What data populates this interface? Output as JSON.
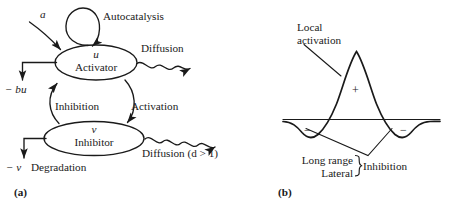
{
  "figure": {
    "panel_a": {
      "caption": "(a)",
      "nodes": [
        {
          "symbol": "u",
          "name": "Activator"
        },
        {
          "symbol": "v",
          "name": "Inhibitor"
        }
      ],
      "labels": {
        "autocatalysis": "Autocatalysis",
        "source": "a",
        "activator_decay": "− bu",
        "activator_diffusion": "Diffusion",
        "inhibition": "Inhibition",
        "activation": "Activation",
        "inhibitor_diffusion": "Diffusion (d > 1)",
        "inhibitor_decay": "− v",
        "degradation": "Degradation"
      }
    },
    "panel_b": {
      "caption": "(b)",
      "labels": {
        "local_activation_line1": "Local",
        "local_activation_line2": "activation",
        "plus_sign": "+",
        "minus_left": "−",
        "minus_right": "−",
        "brace_line1": "Long range",
        "brace_line2": "Lateral",
        "inhibition": "Inhibition"
      }
    }
  },
  "colors": {
    "ink": "#1a1a1a",
    "background": "#ffffff"
  }
}
